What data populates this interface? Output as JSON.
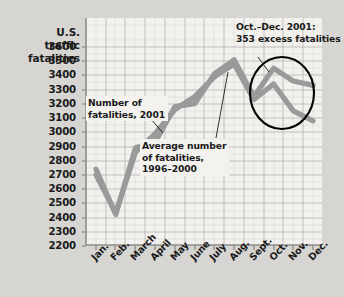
{
  "chart_data": {
    "type": "line",
    "title": "",
    "ylabel": "U.S. traffic fatalities",
    "xlabel": "",
    "grid": true,
    "legend": "annotations",
    "ylim": [
      2200,
      3650
    ],
    "yticks": [
      3600,
      3500,
      3400,
      3300,
      3200,
      3100,
      3000,
      2900,
      2800,
      2700,
      2600,
      2500,
      2400,
      2300,
      2200
    ],
    "categories": [
      "Jan.",
      "Feb.",
      "March",
      "April",
      "May",
      "June",
      "July",
      "Aug.",
      "Sept.",
      "Oct.",
      "Nov.",
      "Dec."
    ],
    "series": [
      {
        "name": "Number of fatalities, 2001",
        "color": "#9a9a9a",
        "values": [
          2740,
          2420,
          2890,
          2930,
          3180,
          3200,
          3410,
          3510,
          3250,
          3450,
          3360,
          3330
        ]
      },
      {
        "name": "Average number of fatalities, 1996–2000",
        "color": "#9a9a9a",
        "values": [
          2700,
          2430,
          2860,
          2990,
          3160,
          3250,
          3390,
          3480,
          3230,
          3340,
          3150,
          3080
        ]
      }
    ],
    "annotations": [
      {
        "id": "callout-2001",
        "text_lines": [
          "Number of",
          "fatalities, 2001"
        ]
      },
      {
        "id": "callout-avg",
        "text_lines": [
          "Average number",
          "of fatalities,",
          "1996–2000"
        ]
      },
      {
        "id": "callout-oct",
        "text_lines": [
          "Oct.–Dec. 2001:",
          "353 excess fatalities"
        ]
      }
    ],
    "highlight": {
      "shape": "ellipse",
      "label": "Oct.–Dec. 2001 highlight",
      "months": [
        "Oct.",
        "Nov.",
        "Dec."
      ]
    }
  },
  "axis": {
    "title_lines": [
      "U.S.",
      "traffic",
      "fatalities"
    ],
    "ytick_labels": [
      "3600",
      "3500",
      "3400",
      "3300",
      "3200",
      "3100",
      "3000",
      "2900",
      "2800",
      "2700",
      "2600",
      "2500",
      "2400",
      "2300",
      "2200"
    ],
    "xtick_labels": [
      "Jan.",
      "Feb.",
      "March",
      "April",
      "May",
      "June",
      "July",
      "Aug.",
      "Sept.",
      "Oct.",
      "Nov.",
      "Dec."
    ]
  },
  "callouts": {
    "fatalities_2001": {
      "line1": "Number of",
      "line2": "fatalities, 2001"
    },
    "average_1996_2000": {
      "line1": "Average number",
      "line2": "of fatalities,",
      "line3": "1996–2000"
    },
    "excess": {
      "line1": "Oct.–Dec. 2001:",
      "line2": "353 excess fatalities"
    }
  },
  "colors": {
    "background": "#d6d5d2",
    "plot_background": "#f2f1ee",
    "grid_major": "#b9b9b5",
    "grid_minor": "#dcdbd7",
    "series_line": "#9a9a9a",
    "axis": "#8a8a86",
    "highlight_ring": "#000000",
    "text": "#1a1a1a"
  }
}
